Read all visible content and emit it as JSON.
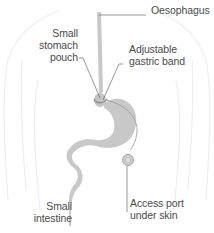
{
  "diagram": {
    "type": "anatomical-illustration",
    "colors": {
      "organ_fill": "#c8c8c8",
      "organ_light": "#d4d4d4",
      "body_outline": "#efefef",
      "leader_line": "#6a6a6a",
      "label_text": "#4a4a4a",
      "background": "#ffffff"
    },
    "labels": {
      "oesophagus": "Oesophagus",
      "small_stomach_pouch": "Small\nstomach\npouch",
      "adjustable_gastric_band": "Adjustable\ngastric band",
      "small_intestine": "Small\nintestine",
      "access_port": "Access port\nunder skin"
    }
  }
}
